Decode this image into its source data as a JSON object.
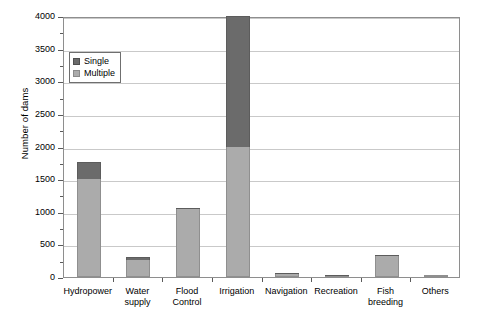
{
  "chart_data": {
    "type": "bar",
    "subtype": "stacked-vertical",
    "title": "",
    "xlabel": "",
    "ylabel": "Number of dams",
    "ylim": [
      0,
      4000
    ],
    "ytick_step": 500,
    "yticks": [
      "0",
      "500",
      "1000",
      "1500",
      "2000",
      "2500",
      "3000",
      "3500",
      "4000"
    ],
    "minor_tick_step": 250,
    "grid": "horizontal",
    "legend_position": "upper-left-inside",
    "categories": [
      "Hydropower",
      "Water supply",
      "Flood Control",
      "Irrigation",
      "Navigation",
      "Recreation",
      "Fish breeding",
      "Others"
    ],
    "category_lines": [
      [
        "Hydropower"
      ],
      [
        "Water",
        "supply"
      ],
      [
        "Flood",
        "Control"
      ],
      [
        "Irrigation"
      ],
      [
        "Navigation"
      ],
      [
        "Recreation"
      ],
      [
        "Fish",
        "breeding"
      ],
      [
        "Others"
      ]
    ],
    "series": [
      {
        "name": "Multiple",
        "color": "#ababab",
        "values": [
          1500,
          260,
          1040,
          2000,
          50,
          30,
          320,
          10
        ]
      },
      {
        "name": "Single",
        "color": "#6b6b6b",
        "values": [
          260,
          40,
          15,
          2000,
          10,
          5,
          10,
          0
        ]
      }
    ],
    "totals": [
      1760,
      300,
      1055,
      4000,
      60,
      35,
      330,
      10
    ]
  },
  "legend": {
    "items": [
      {
        "label": "Single",
        "color": "#6b6b6b",
        "swatch": "single-swatch-icon"
      },
      {
        "label": "Multiple",
        "color": "#ababab",
        "swatch": "multiple-swatch-icon"
      }
    ]
  },
  "colors": {
    "single": "#6b6b6b",
    "multiple": "#ababab",
    "grid": "#c9c9c9",
    "axis": "#8e8e8e",
    "background": "#ffffff"
  }
}
